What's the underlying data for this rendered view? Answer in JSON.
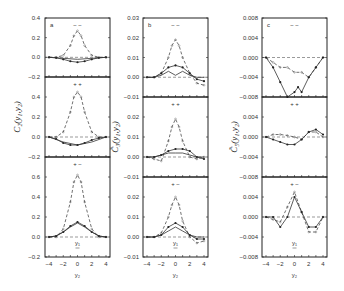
{
  "chart_data": {
    "type": "line",
    "layout": "3 columns x 3 rows of stacked panels sharing x-axis",
    "x_ticks": [
      -4,
      -2,
      0,
      2,
      4
    ],
    "xlabel": "y2",
    "columns": [
      {
        "panel_label": "a",
        "ylabel": "C2(y1,y2)",
        "rows": [
          {
            "marker": "− −",
            "ylim": [
              -0.2,
              0.4
            ],
            "yticks": [
              "0.4",
              "0.2",
              "0.0",
              "-0.2"
            ],
            "series": [
              {
                "name": "dashed",
                "style": "dashed",
                "x": [
                  -4,
                  -3,
                  -2,
                  -1,
                  -0.5,
                  0,
                  0.5,
                  1,
                  2,
                  3,
                  4
                ],
                "y": [
                  0,
                  0,
                  0.02,
                  0.12,
                  0.22,
                  0.27,
                  0.22,
                  0.12,
                  0.02,
                  0,
                  0
                ]
              },
              {
                "name": "solid-dots",
                "style": "solid",
                "x": [
                  -4,
                  -3,
                  -2,
                  -1,
                  0,
                  1,
                  2,
                  3,
                  4
                ],
                "y": [
                  0,
                  -0.005,
                  -0.02,
                  -0.04,
                  -0.05,
                  -0.04,
                  -0.02,
                  -0.005,
                  0
                ]
              },
              {
                "name": "solid",
                "style": "solid",
                "x": [
                  -4,
                  -2,
                  0,
                  2,
                  4
                ],
                "y": [
                  0,
                  -0.01,
                  -0.02,
                  -0.01,
                  0
                ]
              }
            ]
          },
          {
            "marker": "+ +",
            "ylim": [
              -0.2,
              0.6
            ],
            "yticks": [
              "0.4",
              "0.2",
              "0.0",
              "-0.2"
            ],
            "series": [
              {
                "name": "dashed",
                "style": "dashed",
                "x": [
                  -4,
                  -3,
                  -2,
                  -1,
                  -0.5,
                  0,
                  0.5,
                  1,
                  2,
                  3,
                  4
                ],
                "y": [
                  0,
                  0,
                  0.05,
                  0.25,
                  0.4,
                  0.45,
                  0.4,
                  0.25,
                  0.05,
                  0,
                  0
                ]
              },
              {
                "name": "solid-dots",
                "style": "solid",
                "x": [
                  -4,
                  -3,
                  -2,
                  -1,
                  0,
                  1,
                  2,
                  3,
                  4
                ],
                "y": [
                  0,
                  -0.02,
                  -0.06,
                  -0.08,
                  -0.08,
                  -0.06,
                  -0.03,
                  -0.01,
                  0
                ]
              },
              {
                "name": "solid",
                "style": "solid",
                "x": [
                  -4,
                  -2,
                  0,
                  2,
                  4
                ],
                "y": [
                  0,
                  -0.05,
                  -0.08,
                  -0.05,
                  0
                ]
              }
            ]
          },
          {
            "marker": "+ −",
            "ylim": [
              -0.2,
              0.8
            ],
            "yticks": [
              "0.6",
              "0.4",
              "0.2",
              "0.0",
              "-0.2"
            ],
            "series": [
              {
                "name": "dashed",
                "style": "dashed",
                "x": [
                  -4,
                  -3,
                  -2,
                  -1,
                  -0.5,
                  0,
                  0.5,
                  1,
                  2,
                  3,
                  4
                ],
                "y": [
                  0,
                  0,
                  0.08,
                  0.35,
                  0.55,
                  0.62,
                  0.55,
                  0.35,
                  0.08,
                  0,
                  0
                ]
              },
              {
                "name": "solid-dots",
                "style": "solid",
                "x": [
                  -4,
                  -3,
                  -2,
                  -1,
                  0,
                  1,
                  2,
                  3,
                  4
                ],
                "y": [
                  0,
                  0.01,
                  0.05,
                  0.11,
                  0.15,
                  0.11,
                  0.05,
                  0.01,
                  0
                ]
              },
              {
                "name": "solid",
                "style": "solid",
                "x": [
                  -4,
                  -3,
                  -2,
                  -1,
                  0,
                  1,
                  2,
                  3,
                  4
                ],
                "y": [
                  0,
                  0.01,
                  0.05,
                  0.1,
                  0.14,
                  0.1,
                  0.05,
                  0.01,
                  0
                ]
              }
            ],
            "annotation": "y1"
          }
        ]
      },
      {
        "panel_label": "b",
        "ylabel": "C̃3(y1,y2)",
        "rows": [
          {
            "marker": "− −",
            "ylim": [
              -0.01,
              0.03
            ],
            "yticks": [
              "0.03",
              "0.02",
              "0.01",
              "0.00",
              "-0.01"
            ],
            "series": [
              {
                "name": "dashed",
                "style": "dashed",
                "x": [
                  -4,
                  -3,
                  -2,
                  -1,
                  -0.5,
                  0,
                  0.5,
                  1,
                  2,
                  3,
                  4
                ],
                "y": [
                  0,
                  0,
                  0.002,
                  0.01,
                  0.016,
                  0.019,
                  0.016,
                  0.01,
                  0.002,
                  -0.003,
                  -0.004
                ]
              },
              {
                "name": "solid-dots",
                "style": "solid",
                "x": [
                  -4,
                  -3,
                  -2,
                  -1,
                  0,
                  1,
                  2,
                  3,
                  4
                ],
                "y": [
                  0,
                  0,
                  0.002,
                  0.005,
                  0.006,
                  0.005,
                  0.002,
                  -0.001,
                  -0.002
                ]
              },
              {
                "name": "solid",
                "style": "solid",
                "x": [
                  -4,
                  -3,
                  -2,
                  -1,
                  0,
                  1,
                  2,
                  3,
                  4
                ],
                "y": [
                  0,
                  0,
                  0.001,
                  0.003,
                  0.001,
                  0.003,
                  0.001,
                  0,
                  0
                ]
              }
            ]
          },
          {
            "marker": "+ +",
            "ylim": [
              -0.01,
              0.03
            ],
            "yticks": [
              "0.02",
              "0.01",
              "0.00",
              "-0.01"
            ],
            "series": [
              {
                "name": "dashed",
                "style": "dashed",
                "x": [
                  -4,
                  -3,
                  -2,
                  -1,
                  -0.5,
                  0,
                  0.5,
                  1,
                  2,
                  3,
                  4
                ],
                "y": [
                  0,
                  -0.001,
                  -0.002,
                  0.008,
                  0.015,
                  0.019,
                  0.015,
                  0.008,
                  0,
                  -0.001,
                  0
                ]
              },
              {
                "name": "solid-dots",
                "style": "solid",
                "x": [
                  -4,
                  -3,
                  -2,
                  -1,
                  0,
                  1,
                  2,
                  3,
                  4
                ],
                "y": [
                  0,
                  0,
                  0.001,
                  0.003,
                  0.004,
                  0.004,
                  0.003,
                  0,
                  -0.001
                ]
              },
              {
                "name": "solid",
                "style": "solid",
                "x": [
                  -4,
                  -3,
                  -2,
                  -1,
                  0,
                  1,
                  2,
                  3,
                  4
                ],
                "y": [
                  0,
                  0,
                  0.001,
                  0.002,
                  0.002,
                  0.002,
                  0.001,
                  0,
                  0
                ]
              }
            ]
          },
          {
            "marker": "+ −",
            "ylim": [
              -0.01,
              0.03
            ],
            "yticks": [
              "0.02",
              "0.01",
              "0.00",
              "-0.01"
            ],
            "series": [
              {
                "name": "dashed",
                "style": "dashed",
                "x": [
                  -4,
                  -3,
                  -2,
                  -1,
                  -0.5,
                  0,
                  0.5,
                  1,
                  2,
                  3,
                  4
                ],
                "y": [
                  0,
                  0,
                  0.002,
                  0.01,
                  0.016,
                  0.02,
                  0.016,
                  0.008,
                  0,
                  -0.003,
                  -0.002
                ]
              },
              {
                "name": "solid-dots",
                "style": "solid",
                "x": [
                  -4,
                  -3,
                  -2,
                  -1,
                  0,
                  1,
                  2,
                  3,
                  4
                ],
                "y": [
                  0,
                  0,
                  0.001,
                  0.005,
                  0.007,
                  0.005,
                  0.001,
                  -0.001,
                  -0.001
                ]
              },
              {
                "name": "solid",
                "style": "solid",
                "x": [
                  -4,
                  -3,
                  -2,
                  -1,
                  0,
                  1,
                  2,
                  3,
                  4
                ],
                "y": [
                  0,
                  0,
                  0.001,
                  0.003,
                  0.005,
                  0.003,
                  0.001,
                  0,
                  0
                ]
              }
            ],
            "annotation": "y1"
          }
        ]
      },
      {
        "panel_label": "c",
        "ylabel": "C̃5(y1,y2)",
        "rows": [
          {
            "marker": "− −",
            "ylim": [
              -0.008,
              0.008
            ],
            "yticks": [
              "0.008",
              "0.004",
              "0.000",
              "-0.004",
              "-0.008"
            ],
            "series": [
              {
                "name": "dashed",
                "style": "dashed",
                "x": [
                  -4,
                  -3,
                  -2,
                  -1,
                  0,
                  1,
                  2,
                  3,
                  4
                ],
                "y": [
                  0,
                  -0.001,
                  -0.002,
                  -0.002,
                  -0.003,
                  -0.003,
                  -0.004,
                  -0.002,
                  0
                ]
              },
              {
                "name": "solid-dots",
                "style": "solid",
                "x": [
                  -4,
                  -3,
                  -2,
                  -1,
                  0,
                  0.5,
                  1,
                  2,
                  3,
                  4
                ],
                "y": [
                  0,
                  -0.002,
                  -0.005,
                  -0.008,
                  -0.007,
                  -0.006,
                  -0.007,
                  -0.004,
                  -0.002,
                  0
                ]
              }
            ]
          },
          {
            "marker": "+ +",
            "ylim": [
              -0.008,
              0.008
            ],
            "yticks": [
              "0.004",
              "0.000",
              "-0.004",
              "-0.008"
            ],
            "series": [
              {
                "name": "dashed",
                "style": "dashed",
                "x": [
                  -4,
                  -3,
                  -2,
                  -1,
                  0,
                  1,
                  2,
                  3,
                  4
                ],
                "y": [
                  0,
                  0.0005,
                  0.0005,
                  0.0003,
                  0,
                  -0.0005,
                  0.001,
                  0.001,
                  0
                ]
              },
              {
                "name": "solid-dots",
                "style": "solid",
                "x": [
                  -4,
                  -3,
                  -2,
                  -1,
                  0,
                  1,
                  2,
                  3,
                  4
                ],
                "y": [
                  0,
                  -0.0005,
                  -0.001,
                  -0.0015,
                  -0.0015,
                  -0.0005,
                  0.001,
                  0.0015,
                  0.0005
                ]
              }
            ]
          },
          {
            "marker": "+ −",
            "ylim": [
              -0.008,
              0.008
            ],
            "yticks": [
              "0.004",
              "0.000",
              "-0.004",
              "-0.008"
            ],
            "series": [
              {
                "name": "dashed",
                "style": "dashed",
                "x": [
                  -4,
                  -3,
                  -2,
                  -1,
                  0,
                  1,
                  2,
                  3,
                  4
                ],
                "y": [
                  0,
                  -0.0005,
                  -0.001,
                  0.002,
                  0.005,
                  0.001,
                  -0.003,
                  -0.003,
                  0
                ]
              },
              {
                "name": "solid-dots",
                "style": "solid",
                "x": [
                  -4,
                  -3,
                  -2,
                  -1,
                  0,
                  1,
                  2,
                  3,
                  4
                ],
                "y": [
                  0,
                  0,
                  -0.002,
                  0,
                  0.004,
                  0.001,
                  -0.002,
                  -0.002,
                  0
                ]
              }
            ],
            "annotation": "y1"
          }
        ]
      }
    ]
  },
  "labels": {
    "col_a_ylabel": "C₂(y₁,y₂)",
    "col_b_ylabel": "C̃₃(y₁,y₂)",
    "col_c_ylabel": "C̃₅(y₁,y₂)",
    "xlabel": "y₂",
    "annotation": "y₁"
  }
}
